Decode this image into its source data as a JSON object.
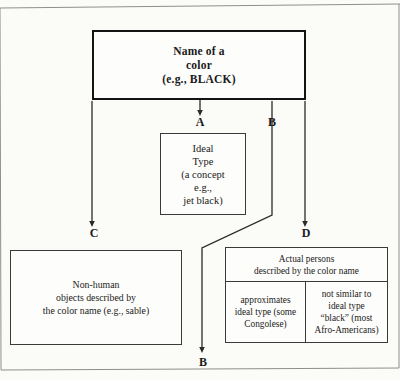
{
  "diagram": {
    "title_node": {
      "name": "name-of-a-color",
      "lines": [
        "Name of a",
        "color",
        "(e.g., BLACK)"
      ]
    },
    "ideal_type_node": {
      "name": "ideal-type",
      "lines": [
        "Ideal",
        "Type",
        "(a concept",
        "e.g.,",
        "jet black)"
      ]
    },
    "nonhuman_node": {
      "name": "non-human-objects",
      "lines": [
        "Non-human",
        "objects described by",
        "the color name (e.g., sable)"
      ]
    },
    "persons_node": {
      "name": "actual-persons",
      "header_lines": [
        "Actual persons",
        "described by the color name"
      ],
      "left_cell_lines": [
        "approximates",
        "ideal type (some",
        "Congolese)"
      ],
      "right_cell_lines": [
        "not similar to",
        "ideal type",
        "“black” (most",
        "Afro-Americans)"
      ]
    },
    "edge_labels": {
      "a": "A",
      "b_top": "B",
      "c": "C",
      "d": "D",
      "b_bottom": "B"
    },
    "colors": {
      "background": "#fbfbf8",
      "stroke": "#3a3a3a",
      "root_stroke": "#131313",
      "text": "#1a1a1a"
    }
  }
}
